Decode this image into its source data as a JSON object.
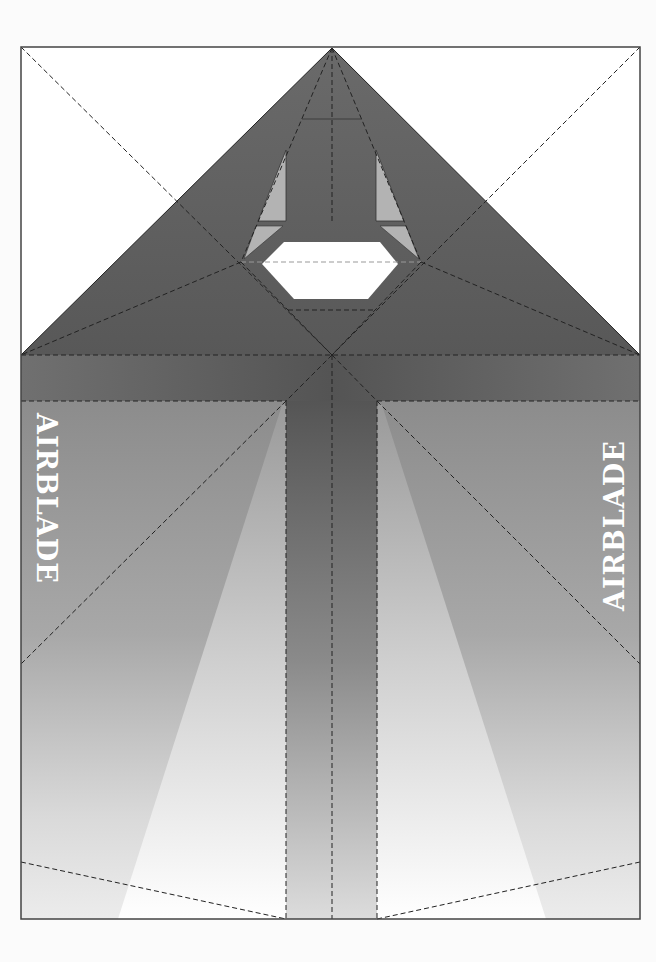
{
  "document": {
    "type": "paper airplane folding template",
    "brand_label_left": "AIRBLADE",
    "brand_label_right": "AIRBLADE"
  },
  "colors": {
    "page_background": "#fbfbfb",
    "sheet_fill": "#ffffff",
    "dark_body": "#5e5e5e",
    "mid_gray": "#8a8a8a",
    "light_gray": "#e6e6e6",
    "flap_fill": "#b5b5b5",
    "fold_line": "#222222",
    "border": "#444444",
    "label_text": "#ffffff"
  },
  "geometry": {
    "sheet": {
      "x": 21,
      "y": 47,
      "width": 619,
      "height": 872
    },
    "apex": {
      "x": 332,
      "y": 48
    },
    "center_cross": {
      "x": 332,
      "y": 355
    },
    "horizontal_folds_y": [
      355,
      401
    ],
    "vertical_folds_x": [
      286,
      332,
      377
    ]
  }
}
